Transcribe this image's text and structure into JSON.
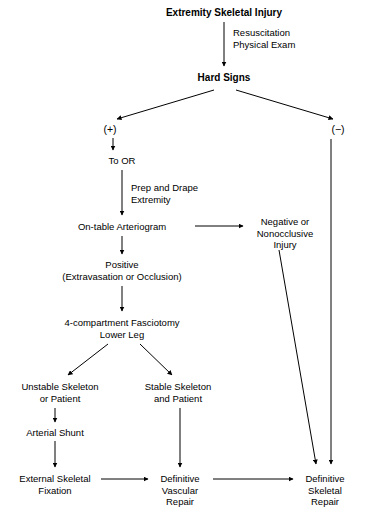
{
  "diagram": {
    "title": "Extremity Skeletal Injury",
    "type": "clinical-algorithm-flowchart",
    "nodes": [
      {
        "id": "injury",
        "label": "Extremity Skeletal Injury",
        "x": 224,
        "y": 7,
        "style": "bold"
      },
      {
        "id": "hard_signs",
        "label": "Hard Signs",
        "x": 224,
        "y": 72,
        "style": "bold"
      },
      {
        "id": "plus",
        "label": "(+)",
        "x": 110,
        "y": 124,
        "style": "sign"
      },
      {
        "id": "minus",
        "label": "(−)",
        "x": 338,
        "y": 124,
        "style": "sign"
      },
      {
        "id": "to_or",
        "label": "To OR",
        "x": 122,
        "y": 155,
        "style": "plain"
      },
      {
        "id": "arteriogram",
        "label": "On-table Arteriogram",
        "x": 122,
        "y": 221,
        "style": "plain"
      },
      {
        "id": "negative",
        "label": "Negative or\nNonocclusive\nInjury",
        "x": 285,
        "y": 216,
        "style": "plain"
      },
      {
        "id": "positive",
        "label": "Positive\n(Extravasation or Occlusion)",
        "x": 122,
        "y": 259,
        "style": "plain"
      },
      {
        "id": "fasciotomy",
        "label": "4-compartment Fasciotomy\nLower Leg",
        "x": 122,
        "y": 317,
        "style": "plain"
      },
      {
        "id": "unstable",
        "label": "Unstable Skeleton\nor Patient",
        "x": 60,
        "y": 381,
        "style": "plain"
      },
      {
        "id": "stable",
        "label": "Stable Skeleton\nand Patient",
        "x": 178,
        "y": 381,
        "style": "plain"
      },
      {
        "id": "shunt",
        "label": "Arterial Shunt",
        "x": 55,
        "y": 427,
        "style": "plain"
      },
      {
        "id": "exfix",
        "label": "External Skeletal\nFixation",
        "x": 55,
        "y": 473,
        "style": "plain"
      },
      {
        "id": "vascular",
        "label": "Definitive\nVascular\nRepair",
        "x": 180,
        "y": 473,
        "style": "plain"
      },
      {
        "id": "skeletal",
        "label": "Definitive\nSkeletal\nRepair",
        "x": 325,
        "y": 473,
        "style": "plain"
      }
    ],
    "edge_labels": [
      {
        "id": "resus",
        "label": "Resuscitation\nPhysical Exam",
        "x": 233,
        "y": 27
      },
      {
        "id": "prep",
        "label": "Prep and Drape\nExtremity",
        "x": 131,
        "y": 182
      }
    ],
    "edges": [
      {
        "from": "injury",
        "to": "hard_signs"
      },
      {
        "from": "hard_signs",
        "to": "plus"
      },
      {
        "from": "hard_signs",
        "to": "minus"
      },
      {
        "from": "plus",
        "to": "to_or"
      },
      {
        "from": "to_or",
        "to": "arteriogram"
      },
      {
        "from": "arteriogram",
        "to": "negative"
      },
      {
        "from": "arteriogram",
        "to": "positive"
      },
      {
        "from": "positive",
        "to": "fasciotomy"
      },
      {
        "from": "fasciotomy",
        "to": "unstable"
      },
      {
        "from": "fasciotomy",
        "to": "stable"
      },
      {
        "from": "unstable",
        "to": "shunt"
      },
      {
        "from": "shunt",
        "to": "exfix"
      },
      {
        "from": "stable",
        "to": "vascular"
      },
      {
        "from": "exfix",
        "to": "vascular"
      },
      {
        "from": "vascular",
        "to": "skeletal"
      },
      {
        "from": "negative",
        "to": "skeletal"
      },
      {
        "from": "minus",
        "to": "skeletal"
      }
    ],
    "colors": {
      "line": "#000000",
      "text": "#000000",
      "background": "#ffffff"
    }
  }
}
